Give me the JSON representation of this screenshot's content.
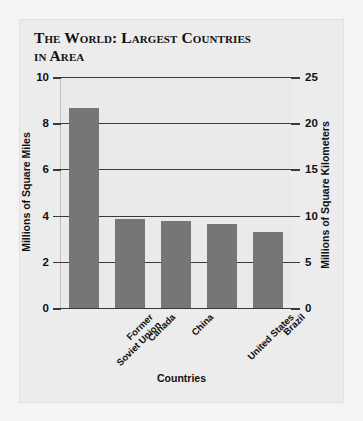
{
  "chart_data": {
    "type": "bar",
    "title": "The World: Largest Countries in Area",
    "title_lines": [
      "The World: Largest Countries",
      "in Area"
    ],
    "categories": [
      "Former\nSoviet Union",
      "Canada",
      "China",
      "United States",
      "Brazil"
    ],
    "values": [
      8.65,
      3.85,
      3.75,
      3.65,
      3.3
    ],
    "xlabel": "Countries",
    "ylabel": "Millions of Square Miles",
    "ylabel_right": "Millions of Square Kilometers",
    "ylim": [
      0,
      10
    ],
    "ylim_right": [
      0,
      25
    ],
    "yticks": [
      "0",
      "2",
      "4",
      "6",
      "8",
      "10"
    ],
    "ytick_values": [
      0,
      2,
      4,
      6,
      8,
      10
    ],
    "yticks_right": [
      "0",
      "5",
      "10",
      "15",
      "20",
      "25"
    ],
    "ytick_values_right": [
      0,
      5,
      10,
      15,
      20,
      25
    ],
    "grid": true,
    "legend": null,
    "bar_color": "#767676",
    "plot_bg": "#eaeaea",
    "panel_bg": "#ececec",
    "page_bg": "#f4f4f4",
    "grid_color": "#3a3a3a",
    "text_color": "#111111"
  }
}
